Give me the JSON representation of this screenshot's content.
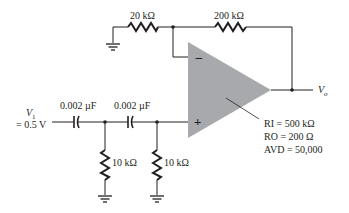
{
  "diagram": {
    "type": "op-amp circuit",
    "feedback_network": {
      "input_resistor": "20 kΩ",
      "feedback_resistor": "200 kΩ"
    },
    "input": {
      "source_name": "V",
      "source_subscript": "1",
      "source_value": "= 0.5 V"
    },
    "filter": {
      "capacitor_1": "0.002 µF",
      "capacitor_2": "0.002 µF",
      "resistor_1": "10 kΩ",
      "resistor_2": "10 kΩ"
    },
    "op_amp": {
      "inverting_symbol": "−",
      "noninverting_symbol": "+",
      "params": [
        "RI = 500 kΩ",
        "RO = 200 Ω",
        "AVD = 50,000"
      ]
    },
    "output": {
      "name": "V",
      "subscript": "o"
    },
    "colors": {
      "wire": "#231f20",
      "opamp_fill": "#a7a9ac"
    }
  }
}
